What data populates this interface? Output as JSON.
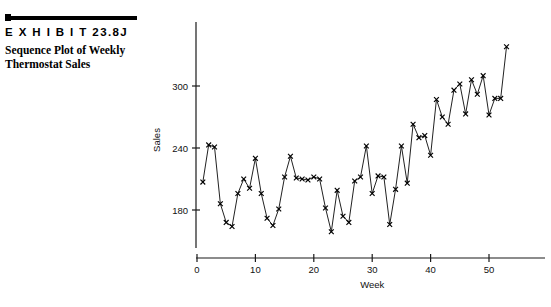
{
  "exhibit": {
    "label": "E X H I B I T   23.8J",
    "title_line1": "Sequence Plot of Weekly",
    "title_line2": "Thermostat Sales",
    "rule_icon": "square-bullet-icon",
    "rule_color": "#000000"
  },
  "chart_data": {
    "type": "line",
    "title": "Sequence Plot of Weekly Thermostat Sales",
    "xlabel": "Week",
    "ylabel": "Sales",
    "xlim": [
      0,
      55
    ],
    "ylim": [
      150,
      345
    ],
    "xticks": [
      0,
      10,
      20,
      30,
      40,
      50
    ],
    "xtick_labels": [
      "0",
      "10",
      "20",
      "30",
      "40",
      "50"
    ],
    "yticks": [
      180,
      240,
      300
    ],
    "ytick_labels": [
      "180",
      "240",
      "300"
    ],
    "grid": false,
    "legend": false,
    "marker": "x",
    "series": [
      {
        "name": "Thermostat Sales",
        "x": [
          1,
          2,
          3,
          4,
          5,
          6,
          7,
          8,
          9,
          10,
          11,
          12,
          13,
          14,
          15,
          16,
          17,
          18,
          19,
          20,
          21,
          22,
          23,
          24,
          25,
          26,
          27,
          28,
          29,
          30,
          31,
          32,
          33,
          34,
          35,
          36,
          37,
          38,
          39,
          40,
          41,
          42,
          43,
          44,
          45,
          46,
          47,
          48,
          49,
          50,
          51,
          52,
          53
        ],
        "values": [
          207,
          243,
          241,
          186,
          168,
          164,
          196,
          210,
          201,
          230,
          196,
          172,
          165,
          181,
          212,
          232,
          211,
          210,
          209,
          212,
          210,
          182,
          159,
          199,
          174,
          168,
          208,
          212,
          242,
          196,
          213,
          212,
          166,
          200,
          242,
          206,
          263,
          250,
          252,
          233,
          287,
          270,
          263,
          296,
          302,
          273,
          306,
          292,
          310,
          272,
          288,
          288,
          338
        ]
      }
    ]
  }
}
